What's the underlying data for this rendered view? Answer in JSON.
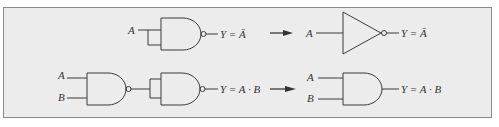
{
  "colors": {
    "background": "#ececec",
    "border": "#8a8a8a",
    "stroke": "#3a3a3a"
  },
  "rows": [
    {
      "id": "not",
      "left": {
        "input_label": "A",
        "gate": "NAND (inputs tied)",
        "output_label": "Y = Ā"
      },
      "arrow": "→",
      "right": {
        "input_label": "A",
        "gate": "NOT (inverter)",
        "output_label": "Y = Ā"
      }
    },
    {
      "id": "and",
      "left": {
        "input_labels": [
          "A",
          "B"
        ],
        "gates": [
          "NAND",
          "NAND (inputs tied)"
        ],
        "output_label": "Y = A · B"
      },
      "arrow": "→",
      "right": {
        "input_labels": [
          "A",
          "B"
        ],
        "gate": "AND",
        "output_label": "Y = A · B"
      }
    }
  ]
}
